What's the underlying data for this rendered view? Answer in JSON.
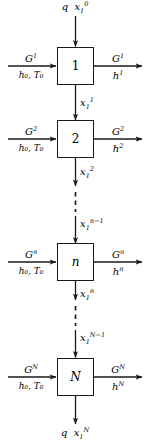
{
  "figure": {
    "type": "process-flow-diagram",
    "line_color": "#1a1a1a",
    "background_color": "#ffffff"
  },
  "top_feed": {
    "label_q": "q",
    "label_x": "x",
    "label_x_sub": "1",
    "label_x_sup": "0"
  },
  "bottom_product": {
    "label_q": "q",
    "label_x": "x",
    "label_x_sub": "1",
    "label_x_sup": "N"
  },
  "stages": [
    {
      "id": "stage-1",
      "box_label": "1",
      "inlet": {
        "gas": "G",
        "gas_sup": "1",
        "enthalpy": "h",
        "enthalpy_sub": "0",
        "temperature": "T",
        "temperature_sub": "0",
        "second_line": "h₀, T₀"
      },
      "outlet": {
        "gas": "G",
        "gas_sup": "1",
        "enthalpy": "h",
        "enthalpy_sup": "1"
      },
      "downstream": {
        "symbol": "x",
        "sub": "1",
        "sup": "1"
      }
    },
    {
      "id": "stage-2",
      "box_label": "2",
      "inlet": {
        "gas": "G",
        "gas_sup": "2",
        "enthalpy": "h",
        "enthalpy_sub": "0",
        "temperature": "T",
        "temperature_sub": "0",
        "second_line": "h₀, T₀"
      },
      "outlet": {
        "gas": "G",
        "gas_sup": "2",
        "enthalpy": "h",
        "enthalpy_sup": "2"
      },
      "downstream": {
        "symbol": "x",
        "sub": "1",
        "sup": "2"
      }
    },
    {
      "id": "stage-n",
      "box_label": "n",
      "inlet": {
        "gas": "G",
        "gas_sup": "n",
        "enthalpy": "h",
        "enthalpy_sub": "0",
        "temperature": "T",
        "temperature_sub": "0",
        "second_line": "h₀, T₀"
      },
      "outlet": {
        "gas": "G",
        "gas_sup": "n",
        "enthalpy": "h",
        "enthalpy_sup": "n"
      },
      "upstream": {
        "symbol": "x",
        "sub": "1",
        "sup": "n−1"
      },
      "downstream": {
        "symbol": "x",
        "sub": "1",
        "sup": "n"
      }
    },
    {
      "id": "stage-N",
      "box_label": "N",
      "inlet": {
        "gas": "G",
        "gas_sup": "N",
        "enthalpy": "h",
        "enthalpy_sub": "0",
        "temperature": "T",
        "temperature_sub": "0",
        "second_line": "h₀, T₀"
      },
      "outlet": {
        "gas": "G",
        "gas_sup": "N",
        "enthalpy": "h",
        "enthalpy_sup": "N"
      },
      "upstream": {
        "symbol": "x",
        "sub": "1",
        "sup": "N−1"
      }
    }
  ],
  "ellipsis_streams": [
    {
      "id": "dash-2-to-n",
      "style": "dashed"
    },
    {
      "id": "dash-n-to-N",
      "style": "dashed"
    }
  ]
}
